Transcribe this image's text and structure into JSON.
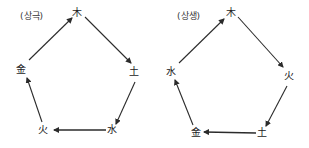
{
  "diagrams": [
    {
      "title": "(상극)",
      "meaning": "mutual overcoming cycle",
      "nodes": [
        {
          "label": "木",
          "x": 77,
          "y": 13
        },
        {
          "label": "土",
          "x": 134,
          "y": 72
        },
        {
          "label": "水",
          "x": 112,
          "y": 130
        },
        {
          "label": "火",
          "x": 43,
          "y": 130
        },
        {
          "label": "金",
          "x": 21,
          "y": 70
        }
      ],
      "edges": [
        {
          "from": "金",
          "to": "木"
        },
        {
          "from": "木",
          "to": "土"
        },
        {
          "from": "土",
          "to": "水"
        },
        {
          "from": "水",
          "to": "火"
        },
        {
          "from": "火",
          "to": "金"
        }
      ]
    },
    {
      "title": "(상생)",
      "meaning": "mutual generation cycle",
      "nodes": [
        {
          "label": "木",
          "x": 231,
          "y": 13
        },
        {
          "label": "火",
          "x": 289,
          "y": 76
        },
        {
          "label": "土",
          "x": 262,
          "y": 133
        },
        {
          "label": "金",
          "x": 196,
          "y": 133
        },
        {
          "label": "水",
          "x": 171,
          "y": 72
        }
      ],
      "edges": [
        {
          "from": "水",
          "to": "木"
        },
        {
          "from": "木",
          "to": "火"
        },
        {
          "from": "火",
          "to": "土"
        },
        {
          "from": "土",
          "to": "金"
        },
        {
          "from": "金",
          "to": "水"
        }
      ]
    }
  ],
  "colors": {
    "line": "#2b2b2b",
    "background": "#ffffff"
  }
}
